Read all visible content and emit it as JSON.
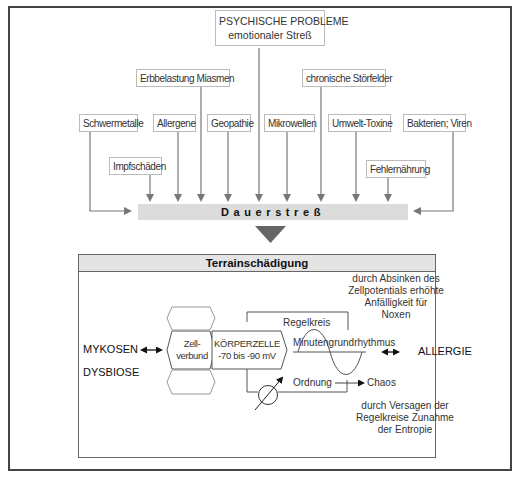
{
  "top": {
    "psych_line1": "PSYCHISCHE PROBLEME",
    "psych_line2": "emotionaler Streß",
    "erb": "Erbbelastung Miasmen",
    "chron": "chronische Störfelder",
    "schwer": "Schwermetalle",
    "allergene": "Allergene",
    "geopathie": "Geopathie",
    "mikrowellen": "Mikrowellen",
    "umwelt": "Umwelt-Toxine",
    "bakterien": "Bakterien; Viren",
    "impf": "Impfschäden",
    "fehl": "Fehlernährung"
  },
  "bar": {
    "label": "Dauerstreß"
  },
  "terrain": {
    "title": "Terrainschädigung",
    "note_top": [
      "durch Absinken des",
      "Zellpotentials erhöhte",
      "Anfälligkeit für",
      "Noxen"
    ],
    "regelkreis": "Regelkreis",
    "minuten": "Minutengrundrhythmus",
    "left_1": "MYKOSEN",
    "left_2": "DYSBIOSE",
    "right": "ALLERGIE",
    "zell_1": "Zell-",
    "zell_2": "verbund",
    "cell_1": "KÖRPERZELLE",
    "cell_2": "-70 bis -90  mV",
    "ordnung": "Ordnung",
    "chaos": "Chaos",
    "note_bottom": [
      "durch Versagen der",
      "Regelkreise Zunahme",
      "der Entropie"
    ]
  },
  "colors": {
    "bar": "#dcdcdc",
    "header": "#e4e4e4",
    "arrow": "#777777",
    "border": "#444444"
  }
}
